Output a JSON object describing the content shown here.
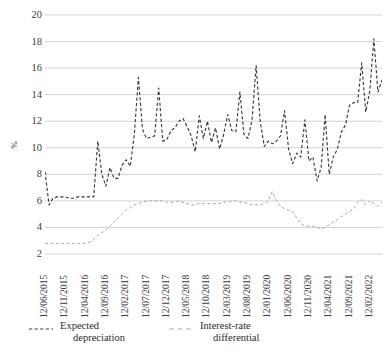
{
  "chart_data": {
    "type": "line",
    "title": "",
    "xlabel": "",
    "ylabel": "%",
    "ylim": [
      2,
      20
    ],
    "ytick_labels": [
      "20",
      "18",
      "16",
      "14",
      "12",
      "10",
      "8",
      "6",
      "4",
      "2"
    ],
    "ytick_values": [
      20,
      18,
      16,
      14,
      12,
      10,
      8,
      6,
      4,
      2
    ],
    "grid": true,
    "legend_position": "bottom-left",
    "xtick_labels": [
      "12/06/2015",
      "12/11/2015",
      "12/04/2016",
      "12/09/2016",
      "12/02/2017",
      "12/07/2017",
      "12/12/2017",
      "12/05/2018",
      "12/10/2018",
      "12/03/2019",
      "12/08/2019",
      "12/01/2020",
      "12/06/2020",
      "12/11/2020",
      "12/04/2021",
      "12/09/2021",
      "12/02/2022"
    ],
    "xtick_index": [
      0,
      5,
      10,
      15,
      20,
      25,
      30,
      35,
      40,
      45,
      50,
      55,
      60,
      65,
      70,
      75,
      80
    ],
    "n_points": 84,
    "series": [
      {
        "name": "Expected depreciation",
        "color": "#3a3a3a",
        "dash": "dashed",
        "values": [
          8.2,
          5.7,
          6.2,
          6.3,
          6.3,
          6.3,
          6.2,
          6.2,
          6.3,
          6.3,
          6.3,
          6.3,
          6.3,
          10.5,
          8.0,
          7.1,
          8.5,
          7.7,
          7.7,
          8.7,
          9.1,
          8.6,
          11.0,
          15.3,
          11.4,
          10.7,
          10.8,
          10.9,
          14.5,
          10.5,
          10.6,
          11.3,
          11.5,
          12.0,
          12.2,
          11.6,
          10.9,
          9.7,
          12.4,
          10.7,
          12.0,
          10.4,
          11.5,
          9.9,
          11.0,
          12.5,
          11.3,
          11.2,
          14.2,
          11.0,
          10.7,
          12.1,
          16.2,
          12.0,
          10.1,
          10.5,
          10.3,
          10.5,
          10.9,
          12.8,
          9.9,
          8.8,
          9.6,
          9.3,
          12.1,
          9.0,
          9.3,
          7.5,
          8.5,
          12.5,
          8.0,
          9.3,
          9.9,
          11.2,
          11.7,
          13.2,
          13.4,
          13.4,
          16.4,
          12.7,
          14.3,
          18.2,
          14.2,
          15.1
        ]
      },
      {
        "name": "Interest-rate differential",
        "color": "#a9a9a9",
        "dash": "dashed",
        "values": [
          2.8,
          2.8,
          2.8,
          2.8,
          2.8,
          2.8,
          2.8,
          2.8,
          2.8,
          2.8,
          2.8,
          2.9,
          3.1,
          3.4,
          3.6,
          3.8,
          4.1,
          4.4,
          4.7,
          5.0,
          5.3,
          5.5,
          5.7,
          5.8,
          5.9,
          6.0,
          6.0,
          6.0,
          6.0,
          6.0,
          5.9,
          5.9,
          5.9,
          6.0,
          5.9,
          5.8,
          5.7,
          5.7,
          5.8,
          5.8,
          5.8,
          5.8,
          5.8,
          5.8,
          5.9,
          5.9,
          6.0,
          6.0,
          5.9,
          5.9,
          5.8,
          5.7,
          5.7,
          5.7,
          5.8,
          6.0,
          6.7,
          6.0,
          5.6,
          5.4,
          5.3,
          5.2,
          4.7,
          4.3,
          4.1,
          4.1,
          4.1,
          4.0,
          3.9,
          4.0,
          4.2,
          4.4,
          4.6,
          4.8,
          5.0,
          5.2,
          5.4,
          5.9,
          6.1,
          5.7,
          6.0,
          5.8,
          5.6,
          5.9
        ]
      }
    ],
    "annotations": []
  },
  "legend": {
    "entries": [
      {
        "label_line1": "Expected",
        "label_line2": "depreciation",
        "color": "#3a3a3a"
      },
      {
        "label_line1": "Interest-rate",
        "label_line2": "differential",
        "color": "#a9a9a9"
      }
    ]
  },
  "axis": {
    "y_title": "%"
  }
}
